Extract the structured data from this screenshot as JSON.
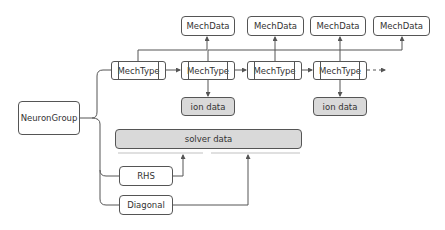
{
  "diagram": {
    "root": {
      "label": "NeuronGroup"
    },
    "mech_types": [
      {
        "label": "MechType"
      },
      {
        "label": "MechType"
      },
      {
        "label": "MechType"
      },
      {
        "label": "MechType"
      }
    ],
    "mech_data": [
      {
        "label": "MechData"
      },
      {
        "label": "MechData"
      },
      {
        "label": "MechData"
      },
      {
        "label": "MechData"
      }
    ],
    "ion_data": [
      {
        "label": "ion data"
      },
      {
        "label": "ion data"
      }
    ],
    "solver": {
      "label": "solver data"
    },
    "rhs": {
      "label": "RHS"
    },
    "diagonal": {
      "label": "Diagonal"
    },
    "colors": {
      "stroke": "#555555",
      "grey_fill": "#d9d9d9",
      "background": "#ffffff"
    }
  }
}
